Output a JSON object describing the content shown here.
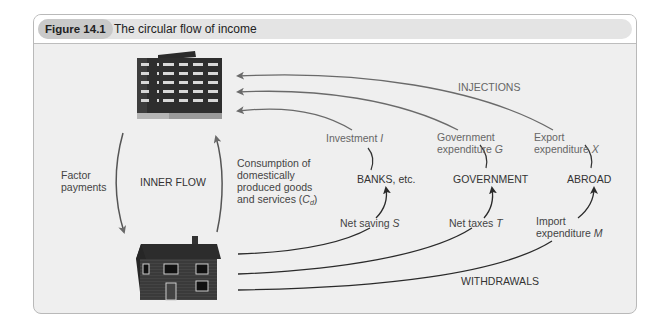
{
  "figure": {
    "number": "Figure 14.1",
    "title": "The circular flow of income"
  },
  "nodes": {
    "firms": {
      "icon": "office-building-icon"
    },
    "households": {
      "icon": "house-icon"
    },
    "banks": "BANKS, etc.",
    "government": "GOVERNMENT",
    "abroad": "ABROAD"
  },
  "inner": {
    "label": "INNER FLOW",
    "factor_line1": "Factor",
    "factor_line2": "payments",
    "consumption_line1": "Consumption of",
    "consumption_line2": "domestically",
    "consumption_line3": "produced goods",
    "consumption_line4_prefix": "and services (",
    "consumption_symbol": "C",
    "consumption_sub": "d",
    "consumption_suffix": ")"
  },
  "injections": {
    "label": "INJECTIONS",
    "investment": "Investment",
    "investment_sym": "I",
    "gov_line1": "Government",
    "gov_line2": "expenditure",
    "gov_sym": "G",
    "export_line1": "Export",
    "export_line2": "expenditure",
    "export_sym": "X"
  },
  "withdrawals": {
    "label": "WITHDRAWALS",
    "saving": "Net saving",
    "saving_sym": "S",
    "taxes": "Net taxes",
    "taxes_sym": "T",
    "import_line1": "Import",
    "import_line2": "expenditure",
    "import_sym": "M"
  },
  "colors": {
    "frame_bg": "#efefef",
    "header_band": "#e4e4e4",
    "badge": "#c9c9c9",
    "injection_line": "#6a6a6a",
    "withdrawal_line": "#2a2a2a"
  }
}
